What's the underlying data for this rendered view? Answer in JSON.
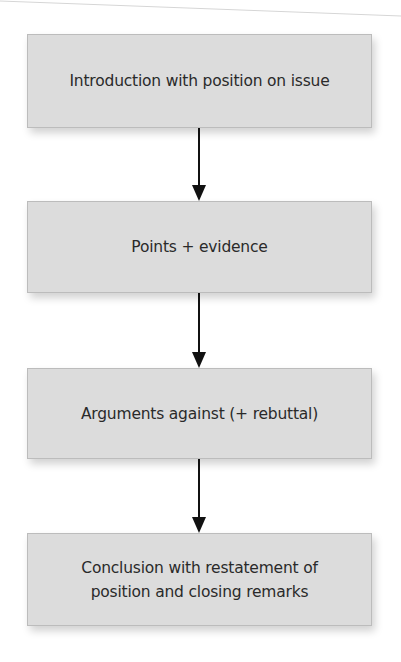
{
  "diagram": {
    "type": "flowchart",
    "direction": "top-to-bottom",
    "colors": {
      "box_fill": "#dcdcdc",
      "box_border": "#bcbcbc",
      "arrow": "#111111",
      "text": "#2a2a2a",
      "background": "#ffffff"
    },
    "nodes": [
      {
        "id": "intro",
        "lines": [
          "Introduction with position on issue"
        ]
      },
      {
        "id": "points",
        "lines": [
          "Points + evidence"
        ]
      },
      {
        "id": "arguments",
        "lines": [
          "Arguments against (+ rebuttal)"
        ]
      },
      {
        "id": "conclusion",
        "lines": [
          "Conclusion with restatement of",
          "position and closing remarks"
        ]
      }
    ],
    "edges": [
      {
        "from": "intro",
        "to": "points"
      },
      {
        "from": "points",
        "to": "arguments"
      },
      {
        "from": "arguments",
        "to": "conclusion"
      }
    ]
  }
}
